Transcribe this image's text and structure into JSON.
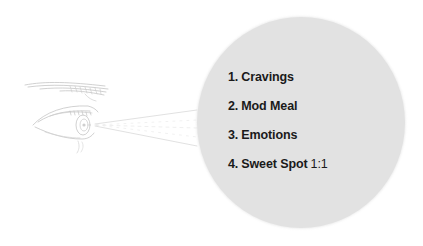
{
  "diagram": {
    "colors": {
      "background": "#ffffff",
      "circle_fill": "#e2e2e2",
      "text": "#1a1a1a",
      "sketch_stroke": "#b8b8b8"
    },
    "illustration": {
      "icon": "eye-sketch-icon",
      "rays_icon": "sight-line-rays"
    },
    "steps": [
      {
        "number": "1.",
        "label": "Cravings",
        "suffix": ""
      },
      {
        "number": "2.",
        "label": "Mod Meal",
        "suffix": ""
      },
      {
        "number": "3.",
        "label": "Emotions",
        "suffix": ""
      },
      {
        "number": "4.",
        "label": "Sweet Spot",
        "suffix": "1:1"
      }
    ]
  }
}
